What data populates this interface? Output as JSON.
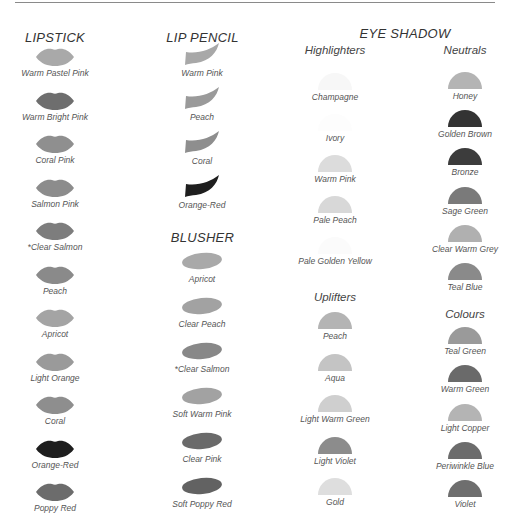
{
  "sections": {
    "lipstick": {
      "title": "LIPSTICK",
      "items": [
        {
          "name": "Warm Pastel Pink",
          "color": "#a9a9a9"
        },
        {
          "name": "Warm Bright Pink",
          "color": "#6e6e6e"
        },
        {
          "name": "Coral Pink",
          "color": "#8f8f8f"
        },
        {
          "name": "Salmon Pink",
          "color": "#8c8c8c"
        },
        {
          "name": "*Clear Salmon",
          "color": "#7d7d7d"
        },
        {
          "name": "Peach",
          "color": "#8a8a8a"
        },
        {
          "name": "Apricot",
          "color": "#a4a4a4"
        },
        {
          "name": "Light Orange",
          "color": "#9a9a9a"
        },
        {
          "name": "Coral",
          "color": "#8e8e8e"
        },
        {
          "name": "Orange-Red",
          "color": "#1e1e1e"
        },
        {
          "name": "Poppy Red",
          "color": "#6c6c6c"
        }
      ]
    },
    "lip_pencil": {
      "title": "LIP PENCIL",
      "items": [
        {
          "name": "Warm Pink",
          "color": "#a8a8a8"
        },
        {
          "name": "Peach",
          "color": "#9a9a9a"
        },
        {
          "name": "Coral",
          "color": "#8e8e8e"
        },
        {
          "name": "Orange-Red",
          "color": "#1e1e1e"
        }
      ]
    },
    "blusher": {
      "title": "BLUSHER",
      "items": [
        {
          "name": "Apricot",
          "color": "#a9a9a9"
        },
        {
          "name": "Clear Peach",
          "color": "#a2a2a2"
        },
        {
          "name": "*Clear Salmon",
          "color": "#888888"
        },
        {
          "name": "Soft Warm Pink",
          "color": "#a2a2a2"
        },
        {
          "name": "Clear Pink",
          "color": "#6a6a6a"
        },
        {
          "name": "Soft Poppy Red",
          "color": "#626262"
        }
      ]
    },
    "eye_shadow": {
      "title": "EYE SHADOW",
      "highlighters": {
        "title": "Highlighters",
        "items": [
          {
            "name": "Champagne",
            "color": "#f7f7f7"
          },
          {
            "name": "Ivory",
            "color": "#fdfdfd"
          },
          {
            "name": "Warm Pink",
            "color": "#dcdcdc"
          },
          {
            "name": "Pale Peach",
            "color": "#d8d8d8"
          },
          {
            "name": "Pale Golden Yellow",
            "color": "#fbfbfb"
          }
        ]
      },
      "uplifters": {
        "title": "Uplifters",
        "items": [
          {
            "name": "Peach",
            "color": "#b4b4b4"
          },
          {
            "name": "Aqua",
            "color": "#c4c4c4"
          },
          {
            "name": "Light Warm Green",
            "color": "#cfcfcf"
          },
          {
            "name": "Light Violet",
            "color": "#8c8c8c"
          },
          {
            "name": "Gold",
            "color": "#dedede"
          }
        ]
      },
      "neutrals": {
        "title": "Neutrals",
        "items": [
          {
            "name": "Honey",
            "color": "#b4b4b4"
          },
          {
            "name": "Golden Brown",
            "color": "#333333"
          },
          {
            "name": "Bronze",
            "color": "#3c3c3c"
          },
          {
            "name": "Sage Green",
            "color": "#7a7a7a"
          },
          {
            "name": "Clear Warm Grey",
            "color": "#b0b0b0"
          },
          {
            "name": "Teal Blue",
            "color": "#8a8a8a"
          }
        ]
      },
      "colours": {
        "title": "Colours",
        "items": [
          {
            "name": "Teal Green",
            "color": "#9a9a9a"
          },
          {
            "name": "Warm Green",
            "color": "#6a6a6a"
          },
          {
            "name": "Light Copper",
            "color": "#b4b4b4"
          },
          {
            "name": "Periwinkle Blue",
            "color": "#6c6c6c"
          },
          {
            "name": "Violet",
            "color": "#6e6e6e"
          }
        ]
      }
    }
  }
}
